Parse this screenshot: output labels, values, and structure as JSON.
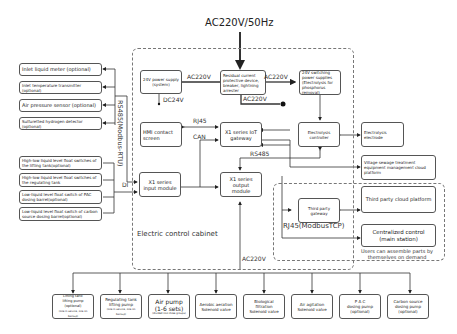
{
  "title": "AC220V/50Hz",
  "cabinet": {
    "label": "Electric control cabinet",
    "power_supply_system": "24V power supply (system)",
    "rcd": "Residual current protective device, breaker, lightning arrester",
    "switching_supply": "24V switching power supplies (Electrolysis for phosphorus removal)",
    "hmi": "HMI contact screen",
    "gateway": "X1 series IoT gateway",
    "electrolysis_controller": "Electrolysis controller",
    "input_module": "X1 series input module",
    "output_module": "X1 series output module"
  },
  "labels": {
    "ac220v_left": "AC220V",
    "ac220v_right": "AC220V",
    "ac220v_bottom": "AC220V",
    "dc24v": "DC24V",
    "rj45": "RJ45",
    "can": "CAN",
    "rs485": "RS485",
    "rs485_modbus": "RS485(Modbus-RTU)",
    "di": "DI",
    "rj45_modbustcp": "RJ45(ModbusTCP)",
    "ac220v_main": "AC220V"
  },
  "sensors": [
    "Inlet liquid meter (optional)",
    "Inlet temperature transmitter (optional)",
    "Air pressure sensor (optional)",
    "Sulfuretted hydrogen detector (optional)"
  ],
  "float_switches": [
    "High-low liquid level float switches of the lifting tank(optional)",
    "High-low liquid level float switches of the regulating tank",
    "Low-liquid level float switch of PAC dosing barrel(optional)",
    "Low-liquid level float switch of carbon source dosing barrel(optional)"
  ],
  "external": {
    "electrolysis_electrode": "Electrolysis electrode",
    "cloud_platform": "Village sewage treatment equipment management cloud platform",
    "third_party_gateway": "Third party gateway",
    "third_party_cloud": "Third party cloud platform",
    "centralized_control": "Centralized control (main station)",
    "user_note": "Users can assemble parts by themselves on demand"
  },
  "outputs": [
    {
      "l1": "Lifting tank",
      "l2": "lifting pump (optional)",
      "l3": "(one in service, one on backup)"
    },
    {
      "l1": "Regulating tank",
      "l2": "lifting pump",
      "l3": "(one in service, one on backup)"
    },
    {
      "l1": "Air pump",
      "l2": "(1-6 sets)",
      "l3": "(divided into three groups)"
    },
    {
      "l1": "Aerobic aeration",
      "l2": "Solenoid valve",
      "l3": ""
    },
    {
      "l1": "Biological filtration",
      "l2": "Solenoid valve",
      "l3": ""
    },
    {
      "l1": "Air agitation",
      "l2": "Solenoid valve",
      "l3": ""
    },
    {
      "l1": "P A C",
      "l2": "dosing pump",
      "l3": "(optional)"
    },
    {
      "l1": "Carbon source",
      "l2": "dosing pump",
      "l3": "(optional)"
    }
  ]
}
